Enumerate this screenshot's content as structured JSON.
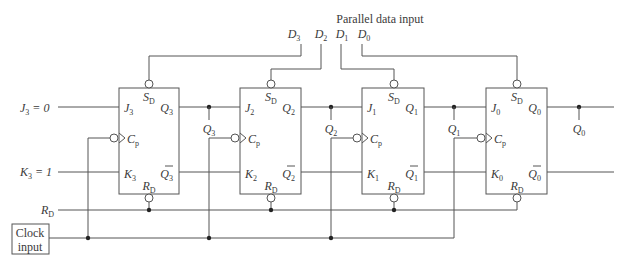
{
  "title": "Parallel data input",
  "data_inputs": [
    "D3",
    "D2",
    "D1",
    "D0"
  ],
  "inputs": {
    "j3": "J3 = 0",
    "k3": "K3 = 1",
    "reset": "RD",
    "clock": [
      "Clock",
      "input"
    ]
  },
  "flip_flops": [
    {
      "id": "FF3",
      "J": "J3",
      "K": "K3",
      "Q": "Q3",
      "Qbar": "Q̄3",
      "S": "SD",
      "R": "RD",
      "C": "Cp",
      "tap": "Q3"
    },
    {
      "id": "FF2",
      "J": "J2",
      "K": "K2",
      "Q": "Q2",
      "Qbar": "Q̄2",
      "S": "SD",
      "R": "RD",
      "C": "Cp",
      "tap": "Q2"
    },
    {
      "id": "FF1",
      "J": "J1",
      "K": "K1",
      "Q": "Q1",
      "Qbar": "Q̄1",
      "S": "SD",
      "R": "RD",
      "C": "Cp",
      "tap": "Q1"
    },
    {
      "id": "FF0",
      "J": "J0",
      "K": "K0",
      "Q": "Q0",
      "Qbar": "Q̄0",
      "S": "SD",
      "R": "RD",
      "C": "Cp",
      "tap": "Q0"
    }
  ]
}
